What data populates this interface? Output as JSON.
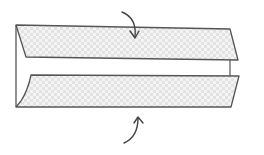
{
  "diagram": {
    "colors": {
      "stroke": "#555555",
      "fill_base": "#e4e4e4",
      "fill_dot": "#f7f7f7",
      "background": "#ffffff"
    },
    "elements": {
      "top_fold": {
        "label": ""
      },
      "bottom_fold": {
        "label": ""
      },
      "top_arrow": {
        "direction": "down",
        "label": ""
      },
      "bottom_arrow": {
        "direction": "up",
        "label": ""
      }
    }
  }
}
